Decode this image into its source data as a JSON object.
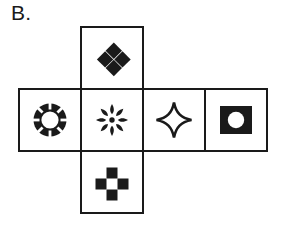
{
  "figure": {
    "label": "B.",
    "type": "cube-net",
    "stroke_color": "#1a1a1a",
    "fill_color": "#1a1a1a",
    "background_color": "#ffffff",
    "stroke_width": 2,
    "cell_size": 62,
    "layout": {
      "row_left": 19,
      "row_top": 89,
      "column_x": 81,
      "top_cell_top": 27,
      "bottom_cell_top": 151,
      "columns": [
        19,
        81,
        143,
        205,
        267
      ]
    }
  },
  "faces": [
    {
      "id": "face-top",
      "position": "top",
      "grid": {
        "col": 1,
        "row": 0
      },
      "icon_name": "four-diamonds-icon",
      "icon_label": "Four diamonds arranged around an empty center",
      "x": 81,
      "y": 27
    },
    {
      "id": "face-row-1",
      "position": "row-1",
      "grid": {
        "col": 0,
        "row": 1
      },
      "icon_name": "sunburst-ring-icon",
      "icon_label": "Filled ring with white center and radiating notches",
      "x": 19,
      "y": 89
    },
    {
      "id": "face-row-2",
      "position": "row-2",
      "grid": {
        "col": 1,
        "row": 1
      },
      "icon_name": "petal-asterisk-icon",
      "icon_label": "Eight teardrop petals radiating from a center dot",
      "x": 81,
      "y": 89
    },
    {
      "id": "face-row-3",
      "position": "row-3",
      "grid": {
        "col": 2,
        "row": 1
      },
      "icon_name": "four-pointed-star-outline-icon",
      "icon_label": "Four-pointed star outline with concave sides",
      "x": 143,
      "y": 89
    },
    {
      "id": "face-row-4",
      "position": "row-4",
      "grid": {
        "col": 3,
        "row": 1
      },
      "icon_name": "square-with-circle-icon",
      "icon_label": "Filled black square containing a white circle",
      "x": 205,
      "y": 89
    },
    {
      "id": "face-bottom",
      "position": "bottom",
      "grid": {
        "col": 1,
        "row": 2
      },
      "icon_name": "square-plus-cross-icon",
      "icon_label": "Plus shape of four black squares around an empty center",
      "x": 81,
      "y": 151
    }
  ]
}
